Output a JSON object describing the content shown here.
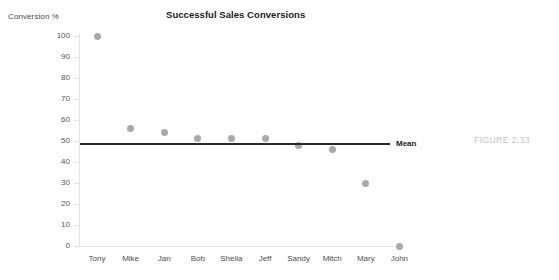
{
  "figure": {
    "caption": "FIGURE 2.33"
  },
  "chart_data": {
    "type": "scatter",
    "title": "Successful Sales Conversions",
    "xlabel": "",
    "ylabel": "Conversion %",
    "ylim": [
      0,
      100
    ],
    "yticks": [
      0,
      10,
      20,
      30,
      40,
      50,
      60,
      70,
      80,
      90,
      100
    ],
    "ytick_labels": [
      "0",
      "10",
      "20",
      "30",
      "40",
      "50",
      "60",
      "70",
      "80",
      "90",
      "100"
    ],
    "grid": false,
    "legend_position": "inline-right",
    "categories": [
      "Tony",
      "Mike",
      "Jan",
      "Bob",
      "Sheila",
      "Jeff",
      "Sandy",
      "Mitch",
      "Mary",
      "John"
    ],
    "values": [
      100,
      56,
      54,
      51,
      51,
      51,
      48,
      46,
      30,
      0
    ],
    "series": [
      {
        "name": "Conversion %",
        "marker": "circle",
        "color": "#a9a9a9",
        "values": [
          100,
          56,
          54,
          51,
          51,
          51,
          48,
          46,
          30,
          0
        ]
      }
    ],
    "annotations": [
      {
        "type": "reference-line",
        "label": "Mean",
        "value": 51,
        "orientation": "horizontal",
        "color": "#2b2b2b"
      }
    ]
  }
}
